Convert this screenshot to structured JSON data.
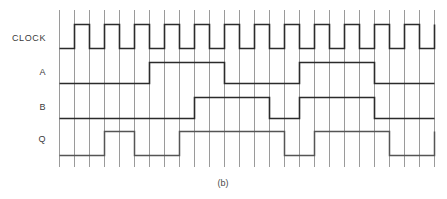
{
  "figure": {
    "caption": "(b)",
    "type": "digital-timing-diagram",
    "background_color": "#ffffff",
    "grid_color": "#9a9a9a",
    "wave_color": "#2b2b2b",
    "q_wave_color": "#555555"
  },
  "labels": {
    "clock": "CLOCK",
    "a": "A",
    "b": "B",
    "q": "Q"
  },
  "chart_data": {
    "type": "line",
    "title": "(b)",
    "xlabel": "",
    "ylabel": "",
    "grid": true,
    "legend": "none",
    "time_unit": "grid-cell",
    "x": [
      0,
      1,
      2,
      3,
      4,
      5,
      6,
      7,
      8,
      9,
      10,
      11,
      12,
      13,
      14,
      15,
      16,
      17,
      18,
      19,
      20,
      21,
      22,
      23,
      24,
      25
    ],
    "xlim": [
      0,
      25
    ],
    "ylim": [
      0,
      1
    ],
    "series": [
      {
        "name": "CLOCK",
        "values": [
          0,
          1,
          0,
          1,
          0,
          1,
          0,
          1,
          0,
          1,
          0,
          1,
          0,
          1,
          0,
          1,
          0,
          1,
          0,
          1,
          0,
          1,
          0,
          1,
          0,
          1
        ],
        "transitions": [
          1,
          2,
          3,
          4,
          5,
          6,
          7,
          8,
          9,
          10,
          11,
          12,
          13,
          14,
          15,
          16,
          17,
          18,
          19,
          20,
          21,
          22,
          23,
          24,
          25
        ],
        "start_level": 0
      },
      {
        "name": "A",
        "values": [
          0,
          0,
          0,
          0,
          0,
          0,
          1,
          1,
          1,
          1,
          1,
          0,
          0,
          0,
          0,
          0,
          1,
          1,
          1,
          1,
          1,
          0,
          0,
          0,
          0,
          0
        ],
        "transitions": [
          6,
          11,
          16,
          21
        ],
        "start_level": 0
      },
      {
        "name": "B",
        "values": [
          0,
          0,
          0,
          0,
          0,
          0,
          0,
          0,
          0,
          1,
          1,
          1,
          1,
          1,
          0,
          0,
          1,
          1,
          1,
          1,
          1,
          0,
          0,
          0,
          0,
          0
        ],
        "transitions": [
          9,
          14,
          16,
          21
        ],
        "start_level": 0
      },
      {
        "name": "Q",
        "values": [
          0,
          0,
          0,
          1,
          1,
          0,
          0,
          0,
          1,
          1,
          1,
          1,
          1,
          1,
          1,
          0,
          0,
          1,
          1,
          1,
          1,
          1,
          0,
          0,
          0,
          1
        ],
        "transitions": [
          3,
          5,
          8,
          15,
          17,
          22,
          25
        ],
        "start_level": 0
      }
    ]
  }
}
